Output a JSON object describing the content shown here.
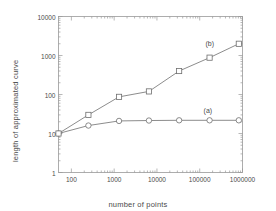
{
  "chart_data": {
    "type": "line",
    "title": "",
    "xlabel": "number of points",
    "ylabel": "length of approximated curve",
    "xscale": "log",
    "yscale": "log",
    "xlim": [
      50,
      1000000
    ],
    "ylim": [
      1,
      10000
    ],
    "grid": false,
    "legend_position": "inline-annotations",
    "xticks": [
      {
        "value": 100,
        "label": "100"
      },
      {
        "value": 1000,
        "label": "1000"
      },
      {
        "value": 10000,
        "label": "10000"
      },
      {
        "value": 100000,
        "label": "100000"
      },
      {
        "value": 1000000,
        "label": "1000000"
      }
    ],
    "yticks": [
      {
        "value": 1,
        "label": "1"
      },
      {
        "value": 10,
        "label": "10"
      },
      {
        "value": 100,
        "label": "100"
      },
      {
        "value": 1000,
        "label": "1000"
      },
      {
        "value": 10000,
        "label": "10000"
      }
    ],
    "series": [
      {
        "name": "(a)",
        "marker": "circle",
        "color": "#6e6e6e",
        "annotation": "(a)",
        "x": [
          50,
          250,
          1300,
          6500,
          33000,
          170000,
          820000
        ],
        "values": [
          10,
          16,
          21,
          21.5,
          21.8,
          21.8,
          21.8
        ]
      },
      {
        "name": "(b)",
        "marker": "square",
        "color": "#6e6e6e",
        "annotation": "(b)",
        "x": [
          50,
          250,
          1300,
          6500,
          33000,
          170000,
          820000
        ],
        "values": [
          10,
          30,
          87,
          120,
          400,
          880,
          2000
        ]
      }
    ]
  },
  "annotations": {
    "a_label": "(a)",
    "b_label": "(b)"
  }
}
